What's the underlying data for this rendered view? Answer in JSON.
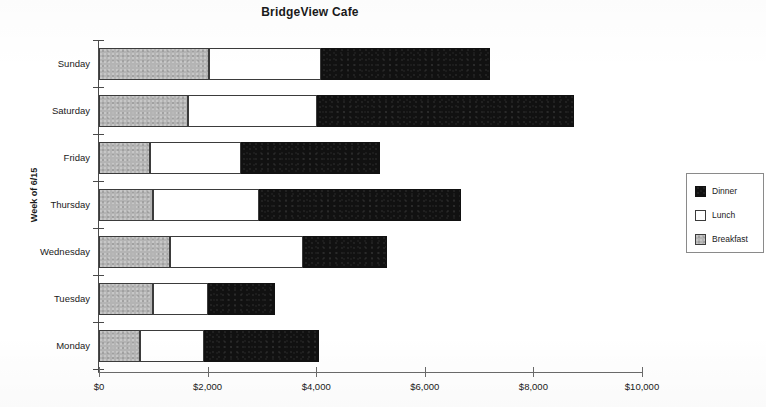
{
  "chart_data": {
    "type": "bar",
    "orientation": "horizontal",
    "stacked": true,
    "title": "BridgeView Cafe",
    "xlabel": "",
    "ylabel": "Week of 6/15",
    "categories": [
      "Sunday",
      "Saturday",
      "Friday",
      "Thursday",
      "Wednesday",
      "Tuesday",
      "Monday"
    ],
    "series": [
      {
        "name": "Breakfast",
        "color": "#b4b4b4",
        "values": [
          2030,
          1630,
          940,
          1000,
          1310,
          1000,
          760
        ]
      },
      {
        "name": "Lunch",
        "color": "#ffffff",
        "values": [
          2050,
          2390,
          1680,
          1950,
          2450,
          1000,
          1170
        ]
      },
      {
        "name": "Dinner",
        "color": "#111111",
        "values": [
          3120,
          4720,
          2560,
          3720,
          1550,
          1240,
          2130
        ]
      }
    ],
    "totals": [
      7200,
      8740,
      5180,
      6670,
      5310,
      3240,
      4060
    ],
    "xlim": [
      0,
      10000
    ],
    "xticks": [
      0,
      2000,
      4000,
      6000,
      8000,
      10000
    ],
    "xtick_labels": [
      "$0",
      "$2,000",
      "$4,000",
      "$6,000",
      "$8,000",
      "$10,000"
    ],
    "grid": false,
    "legend_position": "right",
    "legend_order": [
      "Dinner",
      "Lunch",
      "Breakfast"
    ]
  },
  "legend": {
    "items": [
      {
        "label": "Dinner",
        "swatch": "dinner-swatch"
      },
      {
        "label": "Lunch",
        "swatch": "lunch-swatch"
      },
      {
        "label": "Breakfast",
        "swatch": "breakfast-swatch"
      }
    ]
  }
}
